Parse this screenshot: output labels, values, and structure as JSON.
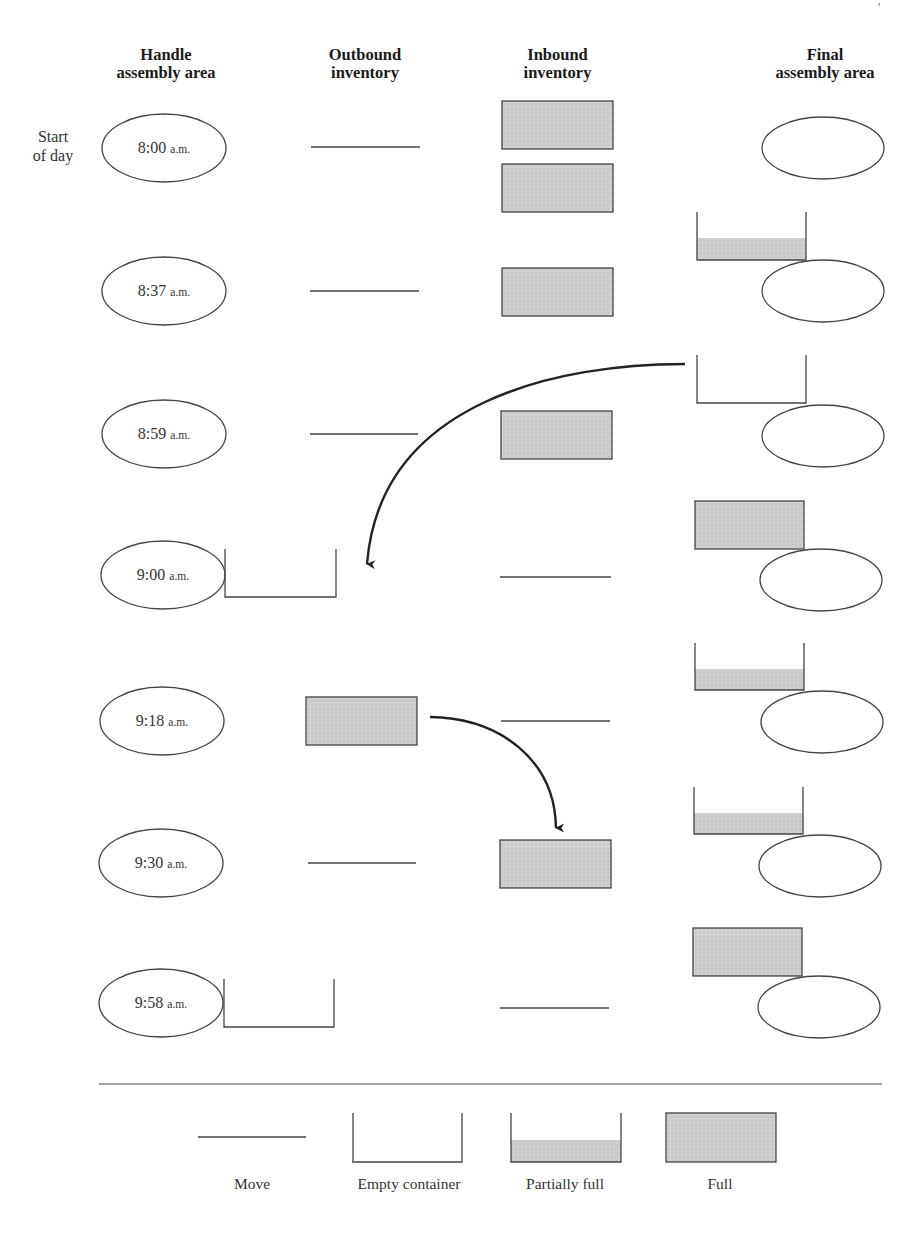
{
  "page_marker": "'",
  "headers": {
    "handle_assembly": [
      "Handle",
      "assembly area"
    ],
    "outbound_inventory": [
      "Outbound",
      "inventory"
    ],
    "inbound_inventory": [
      "Inbound",
      "inventory"
    ],
    "final_assembly": [
      "Final",
      "assembly area"
    ]
  },
  "start_label": [
    "Start",
    "of day"
  ],
  "rows": [
    {
      "time": "8:00",
      "ampm": "a.m.",
      "outbound": "move",
      "inbound": [
        "full",
        "full"
      ],
      "final_container": "none"
    },
    {
      "time": "8:37",
      "ampm": "a.m.",
      "outbound": "move",
      "inbound": [
        "full"
      ],
      "final_container": "partially-full"
    },
    {
      "time": "8:59",
      "ampm": "a.m.",
      "outbound": "move",
      "inbound": [
        "full"
      ],
      "final_container": "empty"
    },
    {
      "time": "9:00",
      "ampm": "a.m.",
      "outbound": "empty-container",
      "inbound": [
        "move"
      ],
      "final_container": "full"
    },
    {
      "time": "9:18",
      "ampm": "a.m.",
      "outbound": "full",
      "inbound": [
        "move"
      ],
      "final_container": "partially-full"
    },
    {
      "time": "9:30",
      "ampm": "a.m.",
      "outbound": "move",
      "inbound": [
        "full"
      ],
      "final_container": "partially-full"
    },
    {
      "time": "9:58",
      "ampm": "a.m.",
      "outbound": "empty-container",
      "inbound": [
        "move"
      ],
      "final_container": "full"
    }
  ],
  "arrows": [
    {
      "from": "final-assembly-empty-container-8:59",
      "to": "handle-assembly-9:00"
    },
    {
      "from": "outbound-full-container-9:18",
      "to": "inbound-inventory-9:30"
    }
  ],
  "legend": {
    "items": [
      {
        "symbol": "move",
        "label": "Move"
      },
      {
        "symbol": "empty-container",
        "label": "Empty container"
      },
      {
        "symbol": "partially-full",
        "label": "Partially full"
      },
      {
        "symbol": "full",
        "label": "Full"
      }
    ]
  },
  "colors": {
    "fill": "#cfcfcf",
    "stroke": "#444444",
    "arrow": "#222222"
  }
}
